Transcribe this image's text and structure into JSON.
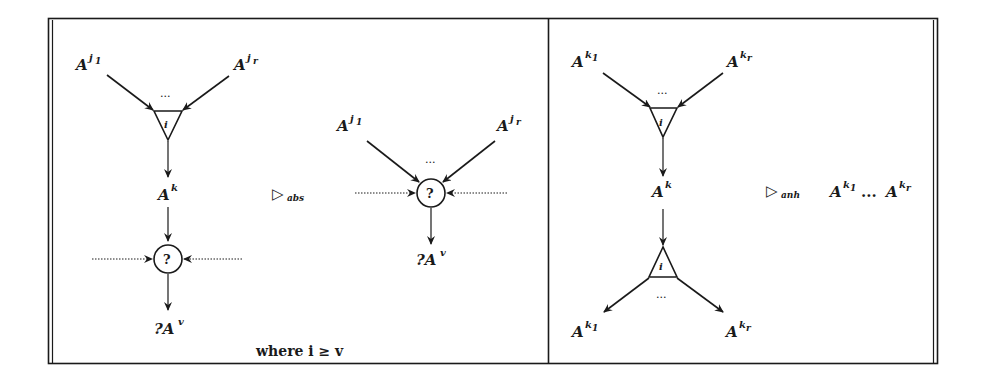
{
  "figure": {
    "left_panel": {
      "rule_symbol": "▷",
      "rule_subscript": "abs",
      "lhs": {
        "inputs": [
          {
            "base": "A",
            "sup": "j",
            "sup_sub": "1"
          },
          {
            "base": "A",
            "sup": "j",
            "sup_sub": "r"
          }
        ],
        "ellipsis": "...",
        "triangle_label": "i",
        "output": {
          "base": "A",
          "sup": "k"
        },
        "query_node": "?",
        "result": {
          "prefix": "?",
          "base": "A",
          "sup": "v"
        }
      },
      "rhs": {
        "inputs": [
          {
            "base": "A",
            "sup": "j",
            "sup_sub": "1"
          },
          {
            "base": "A",
            "sup": "j",
            "sup_sub": "r"
          }
        ],
        "ellipsis": "...",
        "query_node": "?",
        "result": {
          "prefix": "?",
          "base": "A",
          "sup": "v"
        }
      },
      "condition": "where i ≥ v"
    },
    "right_panel": {
      "rule_symbol": "▷",
      "rule_subscript": "anh",
      "lhs": {
        "inputs": [
          {
            "base": "A",
            "sup": "k",
            "sup_sub": "1"
          },
          {
            "base": "A",
            "sup": "k",
            "sup_sub": "r"
          }
        ],
        "ellipsis_top": "...",
        "triangle_top_label": "i",
        "middle": {
          "base": "A",
          "sup": "k"
        },
        "triangle_bottom_label": "i",
        "ellipsis_bottom": "...",
        "outputs": [
          {
            "base": "A",
            "sup": "k",
            "sup_sub": "1"
          },
          {
            "base": "A",
            "sup": "k",
            "sup_sub": "r"
          }
        ]
      },
      "rhs": {
        "first": {
          "base": "A",
          "sup": "k",
          "sup_sub": "1"
        },
        "ellipsis": "...",
        "last": {
          "base": "A",
          "sup": "k",
          "sup_sub": "r"
        }
      }
    }
  }
}
